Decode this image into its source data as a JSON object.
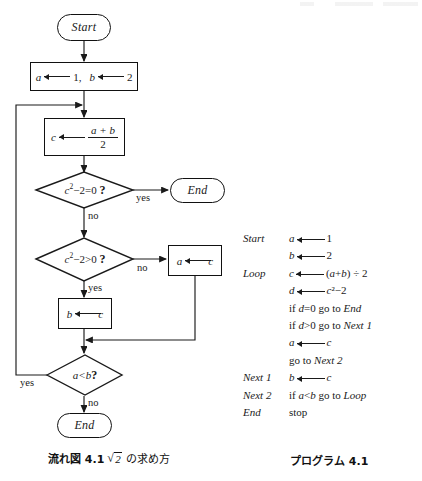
{
  "figure": {
    "flowchart": {
      "start_label": "Start",
      "init_box": {
        "var1": "a",
        "val1": "1",
        "sep": ",",
        "var2": "b",
        "val2": "2"
      },
      "mid_box": {
        "var": "c",
        "num": "a + b",
        "den": "2"
      },
      "decision1": {
        "expr": "c²−2≠0 ?",
        "base": "c",
        "sup": "2",
        "rest": "−2=0",
        "q": "?",
        "yes": "yes",
        "no": "no"
      },
      "end1_label": "End",
      "decision2": {
        "base": "c",
        "sup": "2",
        "rest": "−2>0",
        "q": "?",
        "yes": "yes",
        "no": "no"
      },
      "box_a": {
        "var": "a",
        "val": "c"
      },
      "box_b": {
        "var": "b",
        "val": "c"
      },
      "decision3": {
        "expr": "a<b",
        "q": "?",
        "yes": "yes",
        "no": "no"
      },
      "end2_label": "End"
    },
    "caption_left": {
      "prefix": "流れ図",
      "number": "4.1",
      "radicand": "2",
      "suffix": "の求め方"
    },
    "caption_right": {
      "prefix": "プログラム",
      "number": "4.1"
    }
  },
  "program": {
    "lines": [
      {
        "label": "Start",
        "code_pre": "a",
        "arrow": true,
        "code_post": "1"
      },
      {
        "label": "",
        "code_pre": "b",
        "arrow": true,
        "code_post": "2"
      },
      {
        "label": "Loop",
        "code_pre": "c",
        "arrow": true,
        "code_post": "(a+b) ÷ 2"
      },
      {
        "label": "",
        "code_pre": "d",
        "arrow": true,
        "code_post": "c²−2"
      },
      {
        "label": "",
        "code_pre": "",
        "arrow": false,
        "code_post": "if d=0 go to End"
      },
      {
        "label": "",
        "code_pre": "",
        "arrow": false,
        "code_post": "if d>0 go to Next 1"
      },
      {
        "label": "",
        "code_pre": "a",
        "arrow": true,
        "code_post": "c"
      },
      {
        "label": "",
        "code_pre": "",
        "arrow": false,
        "code_post": "go to Next 2"
      },
      {
        "label": "Next 1",
        "code_pre": "b",
        "arrow": true,
        "code_post": "c"
      },
      {
        "label": "Next 2",
        "code_pre": "",
        "arrow": false,
        "code_post": "if a<b go to Loop"
      },
      {
        "label": "End",
        "code_pre": "",
        "arrow": false,
        "code_post": "stop"
      }
    ]
  },
  "colors": {
    "ink": "#1a1a1a",
    "paper": "#ffffff",
    "rule": "#111111"
  }
}
